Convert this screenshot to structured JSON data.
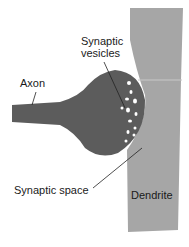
{
  "diagram": {
    "labels": {
      "vesicles_line1": "Synaptic",
      "vesicles_line2": "vesicles",
      "axon": "Axon",
      "synaptic_space": "Synaptic space",
      "dendrite": "Dendrite"
    },
    "colors": {
      "axon": "#5c5c5c",
      "dendrite": "#a6a6a6",
      "vesicle": "#ffffff",
      "leader": "#222222"
    }
  }
}
